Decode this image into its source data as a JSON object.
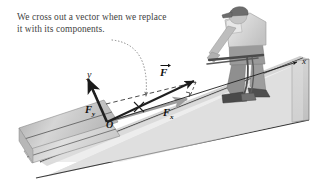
{
  "figure": {
    "background_color": "#ffffff"
  },
  "caption": {
    "line1": "We cross out a vector when we replace",
    "line2": "it with its components.",
    "color": "#3f3f3f",
    "pointer": "dotted-curved-arrow"
  },
  "axes": {
    "x_label": "x",
    "y_label": "y",
    "origin_label": "O",
    "axis_color": "#1a1a1a"
  },
  "vectors": {
    "resultant": {
      "label": "F",
      "overbar": "vector-arrow",
      "crossed_out": true,
      "cross_mark": "X"
    },
    "x_component": {
      "label": "F",
      "subscript": "x"
    },
    "y_component": {
      "label": "F",
      "subscript": "y"
    }
  },
  "annotations": {
    "right_angle_marker": "perpendicular-tick",
    "projection_guide": "dashed-line"
  },
  "scene": {
    "incline_top_color": "#d9d9d9",
    "incline_face_color": "#c9c9c9",
    "incline_edge_color": "#3a3a3a",
    "ground_color": "#e2e2e2",
    "person": {
      "description": "person in cap pushing a mower up the incline",
      "skin_color": "#b5b5b5",
      "shirt_color": "#f2f2f2",
      "pants_color": "#9a9a9a",
      "cap_color": "#6e6e6e",
      "shoe_color": "#555555"
    },
    "tool": {
      "description": "push mower with long handle",
      "handle_color": "#4a4a4a"
    }
  }
}
